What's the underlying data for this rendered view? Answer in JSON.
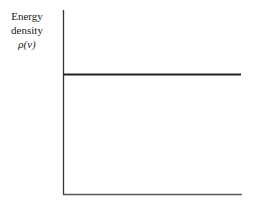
{
  "chart_data": {
    "type": "line",
    "title": "",
    "xlabel": "",
    "ylabel": "Energy density ρ(ν)",
    "series": [
      {
        "name": "energy density",
        "description": "constant horizontal line",
        "x": [
          0,
          1
        ],
        "values": [
          0.65,
          0.65
        ]
      }
    ],
    "ylim": [
      0,
      1
    ],
    "xlim": [
      0,
      1
    ],
    "grid": false,
    "legend": null
  },
  "labels": {
    "ylabel_line1": "Energy",
    "ylabel_line2": "density",
    "ylabel_line3": "ρ(ν)"
  }
}
